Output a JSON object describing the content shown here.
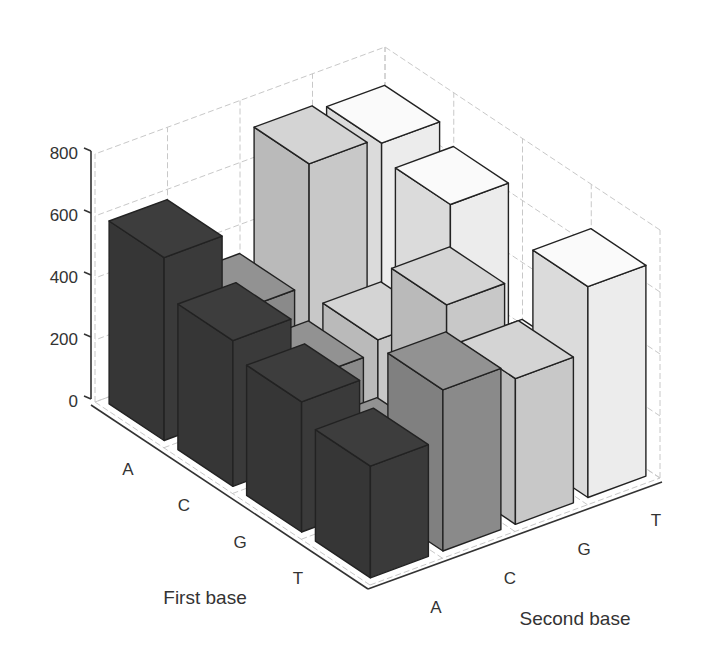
{
  "chart_data": {
    "type": "bar3d",
    "title": "",
    "xlabel": "First base",
    "ylabel": "Second base",
    "zlabel": "",
    "x_categories": [
      "A",
      "C",
      "G",
      "T"
    ],
    "y_categories": [
      "A",
      "C",
      "G",
      "T"
    ],
    "z_ticks": [
      0,
      200,
      400,
      600,
      800
    ],
    "zlim": [
      0,
      800
    ],
    "grid": true,
    "series": [
      {
        "name": "A",
        "color": "#3a3a3a",
        "values": [
          590,
          470,
          420,
          360
        ]
      },
      {
        "name": "C",
        "color": "#8a8a8a",
        "values": [
          330,
          260,
          160,
          520
        ]
      },
      {
        "name": "G",
        "color": "#c8c8c8",
        "values": [
          720,
          300,
          560,
          470
        ]
      },
      {
        "name": "T",
        "color": "#ececec",
        "values": [
          700,
          650,
          240,
          680
        ]
      }
    ],
    "series_note": "series are Second base columns; values indexed by First base A,C,G,T"
  },
  "axes": {
    "z_tick_labels": [
      "0",
      "200",
      "400",
      "600",
      "800"
    ],
    "first_base_tick_labels": [
      "A",
      "C",
      "G",
      "T"
    ],
    "second_base_tick_labels": [
      "A",
      "C",
      "G",
      "T"
    ],
    "first_base_title": "First base",
    "second_base_title": "Second base"
  }
}
